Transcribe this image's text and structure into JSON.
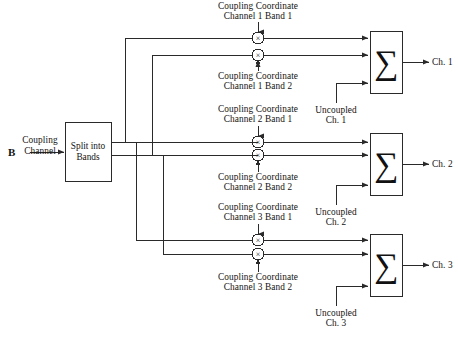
{
  "figure": {
    "panel_letter": "B",
    "width": 458,
    "height": 337,
    "line_color": "#2a2a2a",
    "text_color": "#14120f"
  },
  "input": {
    "line1": "Coupling",
    "line2": "Channel"
  },
  "split_block": {
    "line1": "Split into",
    "line2": "Bands"
  },
  "coupling_coordinates": [
    {
      "line1": "Coupling Coordinate",
      "line2": "Channel 1 Band 1"
    },
    {
      "line1": "Coupling Coordinate",
      "line2": "Channel 1 Band 2"
    },
    {
      "line1": "Coupling Coordinate",
      "line2": "Channel 2 Band 1"
    },
    {
      "line1": "Coupling Coordinate",
      "line2": "Channel 2 Band 2"
    },
    {
      "line1": "Coupling Coordinate",
      "line2": "Channel 3 Band 1"
    },
    {
      "line1": "Coupling Coordinate",
      "line2": "Channel 3 Band 2"
    }
  ],
  "uncoupled_inputs": [
    {
      "line1": "Uncoupled",
      "line2": "Ch. 1"
    },
    {
      "line1": "Uncoupled",
      "line2": "Ch. 2"
    },
    {
      "line1": "Uncoupled",
      "line2": "Ch. 3"
    }
  ],
  "outputs": [
    {
      "label": "Ch. 1"
    },
    {
      "label": "Ch. 2"
    },
    {
      "label": "Ch. 3"
    }
  ],
  "symbols": {
    "multiplier": "×",
    "summer": "∑"
  },
  "multipliers": [
    {
      "name": "ch1-band1"
    },
    {
      "name": "ch1-band2"
    },
    {
      "name": "ch2-band1"
    },
    {
      "name": "ch2-band2"
    },
    {
      "name": "ch3-band1"
    },
    {
      "name": "ch3-band2"
    }
  ],
  "summers": [
    {
      "name": "summer-ch1"
    },
    {
      "name": "summer-ch2"
    },
    {
      "name": "summer-ch3"
    }
  ]
}
